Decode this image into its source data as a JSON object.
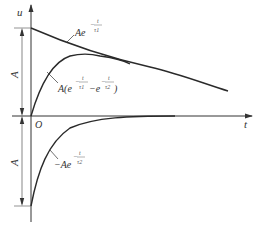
{
  "diagram": {
    "axes": {
      "y_label": "u",
      "x_label": "t",
      "origin_label": "O"
    },
    "dimensions": {
      "upper_amplitude": "A",
      "lower_amplitude": "A"
    },
    "curves": {
      "decay_tau1": {
        "coef": "Ae",
        "exp_num": "t",
        "exp_den": "τ1",
        "exp_sign": "−"
      },
      "difference": {
        "prefix": "A(e",
        "exp1_num": "t",
        "exp1_den": "τ1",
        "mid": "−e",
        "exp2_num": "t",
        "exp2_den": "τ2",
        "suffix": ")",
        "exp_sign": "−"
      },
      "neg_decay_tau2": {
        "coef": "−Ae",
        "exp_num": "t",
        "exp_den": "τ2",
        "exp_sign": "−"
      }
    },
    "colors": {
      "line": "#2a2a2a",
      "axis": "#333333",
      "background": "#ffffff"
    }
  }
}
